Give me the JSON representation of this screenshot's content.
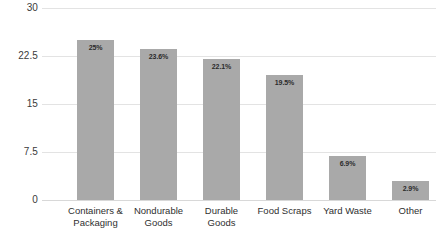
{
  "chart_data": {
    "type": "bar",
    "title": "",
    "subtitle": "",
    "xlabel": "",
    "ylabel": "",
    "ylim": [
      0,
      30
    ],
    "yticks": [
      "0",
      "7.5",
      "15",
      "22.5",
      "30"
    ],
    "ytick_values": [
      0,
      7.5,
      15,
      22.5,
      30
    ],
    "grid": true,
    "legend": false,
    "legend_position": "none",
    "bar_color": "#a9a9a9",
    "gridline_color": "#e3e3e3",
    "background_color": "#ffffff",
    "label_color": "#2b2b2b",
    "categories": [
      "Containers & Packaging",
      "Nondurable Goods",
      "Durable Goods",
      "Food Scraps",
      "Yard Waste",
      "Other"
    ],
    "values": [
      25,
      23.6,
      22.1,
      19.5,
      6.9,
      2.9
    ],
    "data_labels": [
      "25%",
      "23.6%",
      "22.1%",
      "19.5%",
      "6.9%",
      "2.9%"
    ]
  }
}
